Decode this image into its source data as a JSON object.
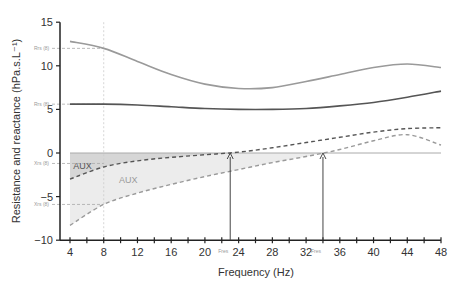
{
  "chart_data": {
    "type": "line",
    "title": "",
    "xlabel": "Frequency (Hz)",
    "ylabel": "Resistance and reactance (hPa.s.L⁻¹)",
    "xlim": [
      3,
      48
    ],
    "ylim": [
      -10,
      15
    ],
    "xticks": [
      4,
      8,
      12,
      16,
      20,
      24,
      28,
      32,
      36,
      40,
      44,
      48
    ],
    "yticks": [
      15,
      10,
      5,
      0,
      -5,
      -10
    ],
    "grid": false,
    "x": [
      4,
      8,
      12,
      16,
      20,
      24,
      28,
      32,
      36,
      40,
      44,
      48
    ],
    "series": [
      {
        "name": "Rrs upper (solid light)",
        "style": "solid",
        "color": "#9a9a9a",
        "values": [
          12.8,
          12.0,
          10.5,
          9.0,
          7.9,
          7.4,
          7.5,
          8.2,
          9.0,
          9.8,
          10.2,
          9.8
        ]
      },
      {
        "name": "Rrs lower (solid dark)",
        "style": "solid",
        "color": "#555555",
        "values": [
          5.6,
          5.6,
          5.5,
          5.3,
          5.1,
          5.0,
          5.0,
          5.1,
          5.4,
          5.8,
          6.4,
          7.1
        ]
      },
      {
        "name": "Xrs upper (dashed dark)",
        "style": "dashed",
        "color": "#555555",
        "values": [
          -3.0,
          -1.6,
          -0.9,
          -0.5,
          -0.2,
          0.1,
          0.6,
          1.2,
          1.8,
          2.4,
          2.8,
          2.9
        ]
      },
      {
        "name": "Xrs lower (dashed light)",
        "style": "dashed",
        "color": "#9a9a9a",
        "values": [
          -8.3,
          -5.9,
          -4.6,
          -3.6,
          -2.7,
          -1.9,
          -1.1,
          -0.4,
          0.4,
          1.4,
          2.1,
          0.9
        ]
      }
    ],
    "annotations": [
      {
        "text": "Rrs (8)",
        "y": 12.0
      },
      {
        "text": "Rrs (8)",
        "y": 5.6
      },
      {
        "text": "Xrs (8)",
        "y": -1.2
      },
      {
        "text": "Xrs (8)",
        "y": -5.9
      },
      {
        "text": "AUX",
        "region": "dark",
        "x": 6,
        "y": -1
      },
      {
        "text": "AUX",
        "region": "light",
        "x": 14,
        "y": -2
      },
      {
        "text": "Fres",
        "x": 23,
        "arrow": true
      },
      {
        "text": "Fres",
        "x": 34,
        "arrow": true
      }
    ],
    "legend": "none"
  },
  "labels": {
    "x_title": "Frequency (Hz)",
    "y_title": "Resistance and reactance (hPa.s.L⁻¹)",
    "aux_dark": "AUX",
    "aux_light": "AUX",
    "fres1": "Fres",
    "fres2": "Fres",
    "r8_upper": "Rrs (8)",
    "r8_lower": "Rrs (8)",
    "x8_upper": "Xrs (8)",
    "x8_lower": "Xrs (8)"
  }
}
